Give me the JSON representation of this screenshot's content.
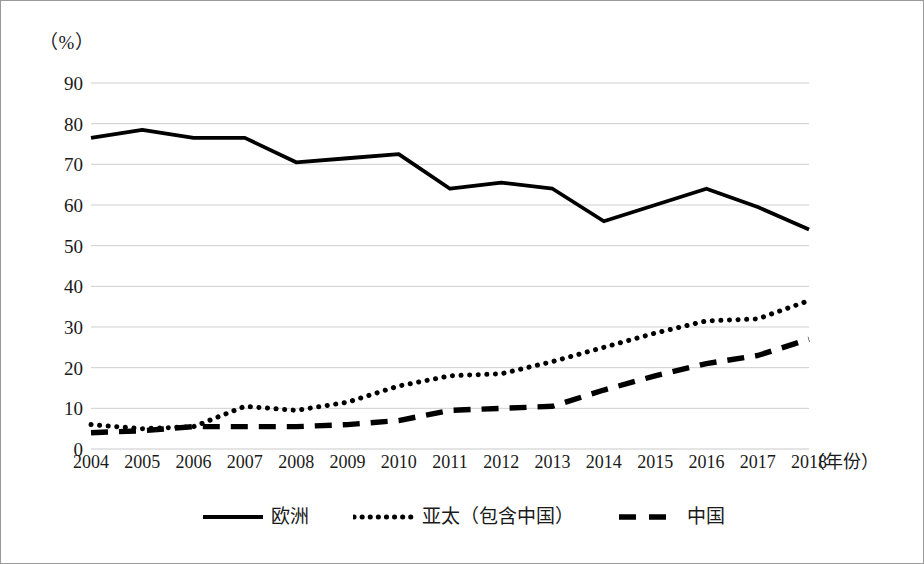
{
  "chart_data": {
    "type": "line",
    "title": "",
    "xlabel": "（年份）",
    "ylabel": "（%）",
    "unit_label": "（%）",
    "grid": true,
    "legend_position": "bottom",
    "xlim": [
      2004,
      2018
    ],
    "ylim": [
      0,
      90
    ],
    "ytick_step": 10,
    "categories": [
      "2004",
      "2005",
      "2006",
      "2007",
      "2008",
      "2009",
      "2010",
      "2011",
      "2012",
      "2013",
      "2014",
      "2015",
      "2016",
      "2017",
      "2018"
    ],
    "yticks": [
      "0",
      "10",
      "20",
      "30",
      "40",
      "50",
      "60",
      "70",
      "80",
      "90"
    ],
    "series": [
      {
        "name": "欧洲",
        "style": "solid",
        "color": "#000000",
        "values": [
          76.5,
          78.5,
          76.5,
          76.5,
          70.5,
          71.5,
          72.5,
          64.0,
          65.5,
          64.0,
          56.0,
          60.0,
          64.0,
          59.5,
          54.0
        ]
      },
      {
        "name": "亚太（包含中国）",
        "style": "dotted",
        "color": "#000000",
        "values": [
          6.0,
          5.0,
          5.5,
          10.5,
          9.5,
          11.5,
          15.5,
          18.0,
          18.5,
          21.5,
          25.0,
          28.5,
          31.5,
          32.0,
          36.5
        ]
      },
      {
        "name": "中国",
        "style": "dashed",
        "color": "#000000",
        "values": [
          4.0,
          4.5,
          5.5,
          5.5,
          5.5,
          6.0,
          7.0,
          9.5,
          10.0,
          10.5,
          14.5,
          18.0,
          21.0,
          23.0,
          27.0
        ]
      }
    ]
  },
  "legend": {
    "items": [
      {
        "label": "欧洲",
        "style": "solid"
      },
      {
        "label": "亚太（包含中国）",
        "style": "dotted"
      },
      {
        "label": "中国",
        "style": "dashed"
      }
    ]
  },
  "axes": {
    "unit_label": "（%）",
    "x_title": "（年份）"
  }
}
